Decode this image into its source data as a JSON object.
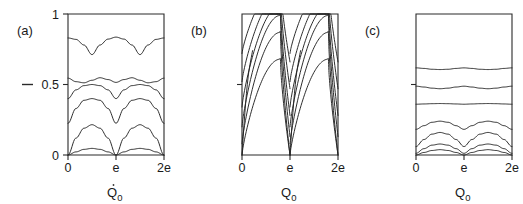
{
  "figure": {
    "background_color": "#ffffff",
    "line_color": "#232323",
    "panels": [
      {
        "id": "a",
        "label": "(a)",
        "xlabel": "Q",
        "xlabel_sub": "0",
        "xlabel_has_dot_accent": true,
        "ylabel": "—",
        "xticks": [
          "0",
          "e",
          "2e"
        ],
        "yticks": [
          "0",
          "0.5",
          "1"
        ],
        "ytick_labeled": true
      },
      {
        "id": "b",
        "label": "(b)",
        "xlabel": "Q",
        "xlabel_sub": "0",
        "xlabel_has_dot_accent": false,
        "ylabel": "",
        "xticks": [
          "0",
          "e",
          "2e"
        ],
        "yticks": [
          "",
          "",
          ""
        ],
        "ytick_labeled": false
      },
      {
        "id": "c",
        "label": "(c)",
        "xlabel": "Q",
        "xlabel_sub": "0",
        "xlabel_has_dot_accent": false,
        "ylabel": "",
        "xticks": [
          "0",
          "e",
          "2e"
        ],
        "yticks": [
          "",
          "",
          ""
        ],
        "ytick_labeled": false
      }
    ]
  },
  "chart_data": {
    "type": "line",
    "title": "",
    "xlabel": "Q_0",
    "ylabel": "E",
    "xlim": [
      0,
      2
    ],
    "ylim": [
      0,
      1
    ],
    "xtick_values": [
      0,
      1,
      2
    ],
    "xtick_labels": [
      "0",
      "e",
      "2e"
    ],
    "ytick_values": [
      0,
      0.5,
      1
    ],
    "ytick_labels": [
      "0",
      "0.5",
      "1"
    ],
    "grid": false,
    "legend": "none",
    "panels": [
      {
        "id": "a",
        "label": "(a)",
        "description": "Bloch energy bands versus quasicharge; lowest bands are nearly parabolic arches pinned to zero at Q0 = 0, e, 2e, higher bands flatten toward constant values.",
        "series": [
          {
            "name": "band-1",
            "baseline": 0.012,
            "amplitude": 0.035,
            "shape": "arch-pinned",
            "flatness": 0.0,
            "values": [
              0.0,
              0.022,
              0.04,
              0.047,
              0.04,
              0.022,
              0.0,
              0.022,
              0.04,
              0.047,
              0.04,
              0.022,
              0.0
            ]
          },
          {
            "name": "band-2",
            "baseline": 0.0,
            "amplitude": 0.215,
            "shape": "arch-pinned",
            "flatness": 0.0,
            "values": [
              0.0,
              0.12,
              0.19,
              0.215,
              0.19,
              0.12,
              0.0,
              0.12,
              0.19,
              0.215,
              0.19,
              0.12,
              0.0
            ]
          },
          {
            "name": "band-3",
            "baseline": 0.225,
            "amplitude": 0.175,
            "shape": "arch-flattop",
            "flatness": 0.35,
            "values": [
              0.225,
              0.33,
              0.388,
              0.4,
              0.388,
              0.33,
              0.225,
              0.33,
              0.388,
              0.4,
              0.388,
              0.33,
              0.225
            ]
          },
          {
            "name": "band-4",
            "baseline": 0.4,
            "amplitude": 0.105,
            "shape": "arch-flattop",
            "flatness": 0.55,
            "values": [
              0.4,
              0.462,
              0.492,
              0.5,
              0.492,
              0.462,
              0.4,
              0.462,
              0.492,
              0.5,
              0.492,
              0.462,
              0.4
            ]
          },
          {
            "name": "band-5",
            "baseline": 0.505,
            "amplitude": 0.045,
            "shape": "wavy",
            "flatness": 0.75,
            "values": [
              0.545,
              0.52,
              0.512,
              0.53,
              0.548,
              0.535,
              0.515,
              0.535,
              0.548,
              0.53,
              0.512,
              0.52,
              0.545
            ]
          },
          {
            "name": "band-6",
            "baseline": 0.7,
            "amplitude": 0.125,
            "shape": "scalloped",
            "flatness": 0.2,
            "values": [
              0.83,
              0.82,
              0.78,
              0.712,
              0.78,
              0.822,
              0.836,
              0.822,
              0.78,
              0.712,
              0.78,
              0.82,
              0.83
            ]
          }
        ]
      },
      {
        "id": "b",
        "label": "(b)",
        "description": "Strongly tilted bands: each branch rises gradually from the left edge and drops steeply at the cusps near Q0 = e and 2e, producing sawtooth-like asymmetric arcs.",
        "series": [
          {
            "name": "branch-1",
            "values": [
              0.0,
              0.25,
              0.47,
              0.61,
              0.66,
              0.6,
              0.0,
              0.25,
              0.47,
              0.61,
              0.66,
              0.6,
              0.0
            ],
            "shape": "asymmetric-sawtooth",
            "skew": 0.72
          },
          {
            "name": "branch-2",
            "values": [
              0.0,
              0.33,
              0.6,
              0.78,
              0.86,
              0.8,
              0.08,
              0.33,
              0.6,
              0.78,
              0.86,
              0.8,
              0.08
            ],
            "shape": "asymmetric-sawtooth",
            "skew": 0.72
          },
          {
            "name": "branch-3",
            "values": [
              0.13,
              0.42,
              0.7,
              0.88,
              0.96,
              0.92,
              0.2,
              0.42,
              0.7,
              0.88,
              0.96,
              0.92,
              0.2
            ],
            "shape": "asymmetric-sawtooth",
            "skew": 0.72
          },
          {
            "name": "branch-4",
            "values": [
              0.28,
              0.56,
              0.82,
              0.97,
              1.0,
              0.99,
              0.34,
              0.56,
              0.82,
              0.97,
              1.0,
              0.99,
              0.34
            ],
            "shape": "asymmetric-sawtooth",
            "skew": 0.72
          },
          {
            "name": "branch-5",
            "values": [
              0.47,
              0.72,
              0.93,
              1.0,
              1.0,
              1.0,
              0.52,
              0.72,
              0.93,
              1.0,
              1.0,
              1.0,
              0.52
            ],
            "shape": "asymmetric-sawtooth",
            "skew": 0.72
          },
          {
            "name": "branch-6",
            "values": [
              0.66,
              0.88,
              1.0,
              1.0,
              1.0,
              1.0,
              0.7,
              0.88,
              1.0,
              1.0,
              1.0,
              1.0,
              0.7
            ],
            "shape": "asymmetric-sawtooth",
            "skew": 0.72
          }
        ]
      },
      {
        "id": "c",
        "label": "(c)",
        "description": "Weakly dispersive bands concentrated in the lower half; the lowest few bands show gentle humps peaking midway between cusps, upper bands are almost flat horizontal lines.",
        "series": [
          {
            "name": "band-1",
            "values": [
              0.0,
              0.018,
              0.032,
              0.038,
              0.032,
              0.018,
              0.0,
              0.018,
              0.032,
              0.038,
              0.032,
              0.018,
              0.0
            ],
            "shape": "arch-pinned"
          },
          {
            "name": "band-2",
            "values": [
              0.012,
              0.045,
              0.07,
              0.078,
              0.07,
              0.045,
              0.012,
              0.045,
              0.07,
              0.078,
              0.07,
              0.045,
              0.012
            ],
            "shape": "arch-pinned"
          },
          {
            "name": "band-3",
            "values": [
              0.06,
              0.11,
              0.148,
              0.16,
              0.148,
              0.11,
              0.06,
              0.11,
              0.148,
              0.16,
              0.148,
              0.11,
              0.06
            ],
            "shape": "wavy"
          },
          {
            "name": "band-4",
            "values": [
              0.182,
              0.208,
              0.232,
              0.24,
              0.232,
              0.208,
              0.182,
              0.208,
              0.232,
              0.24,
              0.232,
              0.208,
              0.182
            ],
            "shape": "wavy"
          },
          {
            "name": "band-5",
            "values": [
              0.36,
              0.362,
              0.364,
              0.365,
              0.364,
              0.362,
              0.36,
              0.362,
              0.364,
              0.365,
              0.364,
              0.362,
              0.36
            ],
            "shape": "near-flat"
          },
          {
            "name": "band-6",
            "values": [
              0.488,
              0.482,
              0.474,
              0.47,
              0.474,
              0.482,
              0.488,
              0.482,
              0.474,
              0.47,
              0.474,
              0.482,
              0.488
            ],
            "shape": "near-flat"
          },
          {
            "name": "band-7",
            "values": [
              0.618,
              0.614,
              0.608,
              0.606,
              0.608,
              0.614,
              0.618,
              0.614,
              0.608,
              0.606,
              0.608,
              0.614,
              0.618
            ],
            "shape": "near-flat"
          }
        ]
      }
    ]
  }
}
